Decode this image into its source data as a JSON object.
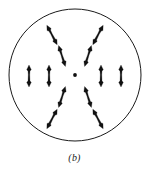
{
  "figure": {
    "caption": "(b)",
    "label_text": "b",
    "colors": {
      "stroke": "#1a1a1a",
      "glyph_fill": "#111111",
      "background": "#ffffff"
    },
    "circle": {
      "center_x": 75,
      "center_y": 75,
      "radius": 66,
      "stroke_width": 1
    },
    "center_dot": {
      "cx": 75,
      "cy": 75,
      "r": 1.9,
      "name": "center-dot"
    },
    "glyph": {
      "name": "double-headed-arrow-spindle",
      "length": 22,
      "half_length": 11,
      "head_width": 4.6,
      "waist_width": 1.5,
      "count": 12
    },
    "glyphs": [
      {
        "name": "glyph-outer-top-left",
        "cx": 52,
        "cy": 35,
        "angle": -28,
        "ring": "outer",
        "sector": "top-left"
      },
      {
        "name": "glyph-outer-top-right",
        "cx": 98,
        "cy": 35,
        "angle": 28,
        "ring": "outer",
        "sector": "top-right"
      },
      {
        "name": "glyph-inner-top-left",
        "cx": 62,
        "cy": 56,
        "angle": -18,
        "ring": "inner",
        "sector": "top-left"
      },
      {
        "name": "glyph-inner-top-right",
        "cx": 88,
        "cy": 56,
        "angle": 18,
        "ring": "inner",
        "sector": "top-right"
      },
      {
        "name": "glyph-outer-left",
        "cx": 29,
        "cy": 76,
        "angle": 0,
        "ring": "outer",
        "sector": "left"
      },
      {
        "name": "glyph-inner-left",
        "cx": 49,
        "cy": 76,
        "angle": 0,
        "ring": "inner",
        "sector": "left"
      },
      {
        "name": "glyph-inner-right",
        "cx": 101,
        "cy": 76,
        "angle": 0,
        "ring": "inner",
        "sector": "right"
      },
      {
        "name": "glyph-outer-right",
        "cx": 121,
        "cy": 76,
        "angle": 0,
        "ring": "outer",
        "sector": "right"
      },
      {
        "name": "glyph-inner-bottom-left",
        "cx": 62,
        "cy": 97,
        "angle": 18,
        "ring": "inner",
        "sector": "bottom-left"
      },
      {
        "name": "glyph-inner-bottom-right",
        "cx": 88,
        "cy": 97,
        "angle": -18,
        "ring": "inner",
        "sector": "bottom-right"
      },
      {
        "name": "glyph-outer-bottom-left",
        "cx": 52,
        "cy": 119,
        "angle": 28,
        "ring": "outer",
        "sector": "bottom-left"
      },
      {
        "name": "glyph-outer-bottom-right",
        "cx": 98,
        "cy": 119,
        "angle": -28,
        "ring": "outer",
        "sector": "bottom-right"
      }
    ]
  }
}
